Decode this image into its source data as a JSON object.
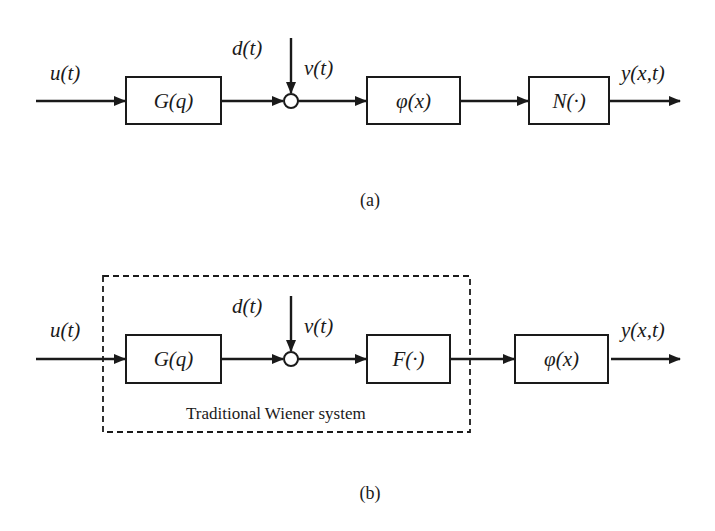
{
  "diagram_a": {
    "caption": "(a)",
    "input_label": "u(t)",
    "disturbance_label": "d(t)",
    "intermediate_label": "v(t)",
    "output_label": "y(x,t)",
    "blocks": [
      {
        "id": "G",
        "label": "G(q)"
      },
      {
        "id": "phi",
        "label": "φ(x)"
      },
      {
        "id": "N",
        "label": "N(·)"
      }
    ],
    "summing_junction": "circle"
  },
  "diagram_b": {
    "caption": "(b)",
    "input_label": "u(t)",
    "disturbance_label": "d(t)",
    "intermediate_label": "v(t)",
    "output_label": "y(x,t)",
    "blocks": [
      {
        "id": "G",
        "label": "G(q)"
      },
      {
        "id": "F",
        "label": "F(·)"
      },
      {
        "id": "phi",
        "label": "φ(x)"
      }
    ],
    "group_label": "Traditional Wiener system",
    "summing_junction": "circle"
  }
}
